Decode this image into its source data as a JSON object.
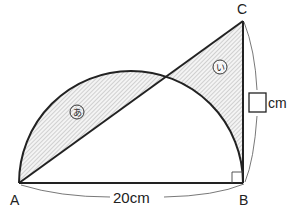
{
  "points": {
    "A": {
      "label": "A",
      "x": 19,
      "y": 183
    },
    "B": {
      "label": "B",
      "x": 243,
      "y": 183
    },
    "C": {
      "label": "C",
      "x": 243,
      "y": 21
    }
  },
  "regions": {
    "a": {
      "label": "あ",
      "fill": "#e8e8e8"
    },
    "i": {
      "label": "い",
      "hatch": "#9a9a9a"
    }
  },
  "measurements": {
    "ab": "20cm",
    "bc_unit": "cm",
    "bc_blank": ""
  },
  "colors": {
    "stroke": "#222222",
    "light_fill": "#e9e9e9",
    "hatch": "#a0a0a0"
  }
}
